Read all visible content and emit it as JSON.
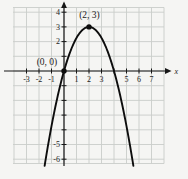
{
  "colors": {
    "background": "#f5f5f3",
    "grid": "#c9cdc9",
    "axis": "#161616",
    "curve": "#0d0d0d",
    "text": "#1c1c1c"
  },
  "chart_data": {
    "type": "line",
    "title": "",
    "equation": "y = 3 - 0.75(x - 2)^2",
    "curve": {
      "vertex": [
        2,
        3
      ],
      "coefficient_a": -0.75,
      "x_intercepts": [
        0,
        4
      ],
      "x_start": -1.55,
      "x_end": 5.55
    },
    "xlabel": "x",
    "ylabel": "",
    "xlim": [
      -4.2,
      8.0
    ],
    "ylim": [
      -6.4,
      4.3
    ],
    "grid": true,
    "x_ticks": [
      -3,
      -2,
      -1,
      1,
      2,
      3,
      4,
      5,
      6,
      7
    ],
    "x_tick_labels": [
      "-3",
      "-2",
      "-1",
      "1",
      "2",
      "3",
      "",
      "5",
      "6",
      "7"
    ],
    "y_ticks": [
      4,
      3,
      2,
      1,
      -1,
      -2,
      -3,
      -4,
      -5,
      -6
    ],
    "y_tick_labels": [
      "4",
      "3",
      "2",
      "",
      "",
      "",
      "",
      "",
      "-5",
      "-6"
    ],
    "points": [
      {
        "x": 0,
        "y": 0,
        "label": "(0, 0)",
        "label_dx": -17,
        "label_dy": -6.5
      },
      {
        "x": 2,
        "y": 3,
        "label": "(2, 3)",
        "label_dx": 0.5,
        "label_dy": -9
      }
    ]
  }
}
